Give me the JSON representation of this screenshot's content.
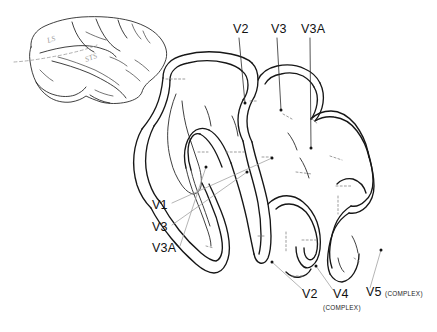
{
  "figure": {
    "background_color": "#ffffff",
    "line_color": "#161616",
    "leader_color": "#9c9c9c",
    "boundary_color": "#8d8d8d"
  },
  "inset": {
    "name": "macaque-lateral-brain-view",
    "sulci": [
      {
        "id": "ls",
        "label": "LS",
        "x": 48,
        "y": 43
      },
      {
        "id": "sts",
        "label": "STS",
        "x": 86,
        "y": 62
      }
    ],
    "section_line": "dashed-section-plane"
  },
  "section": {
    "name": "unfolded-visual-cortex-section",
    "top_labels": [
      {
        "id": "v2-top",
        "label": "V2",
        "x": 233,
        "y": 33,
        "leader_to_x": 245,
        "leader_to_y": 103
      },
      {
        "id": "v3-top",
        "label": "V3",
        "x": 271,
        "y": 33,
        "leader_to_x": 281,
        "leader_to_y": 110
      },
      {
        "id": "v3a-top",
        "label": "V3A",
        "x": 301,
        "y": 33,
        "leader_to_x": 311,
        "leader_to_y": 148
      }
    ],
    "left_labels": [
      {
        "id": "v1-left",
        "label": "V1",
        "x": 152,
        "y": 209,
        "leader_to_x": 272,
        "leader_to_y": 158
      },
      {
        "id": "v3-left",
        "label": "V3",
        "x": 152,
        "y": 231,
        "leader_to_x": 247,
        "leader_to_y": 172
      },
      {
        "id": "v3a-left",
        "label": "V3A",
        "x": 152,
        "y": 252,
        "leader_to_x": 206,
        "leader_to_y": 167
      }
    ],
    "bottom_labels": [
      {
        "id": "v2-bottom",
        "label": "V2",
        "sub": "",
        "x": 302,
        "y": 298,
        "leader_to_x": 272,
        "leader_to_y": 262
      },
      {
        "id": "v4-bottom",
        "label": "V4",
        "sub": "(COMPLEX)",
        "x": 333,
        "y": 298,
        "leader_to_x": 316,
        "leader_to_y": 266
      },
      {
        "id": "v5-bottom",
        "label": "V5",
        "sub": "(COMPLEX)",
        "x": 366,
        "y": 296,
        "leader_to_x": 381,
        "leader_to_y": 250
      }
    ]
  }
}
